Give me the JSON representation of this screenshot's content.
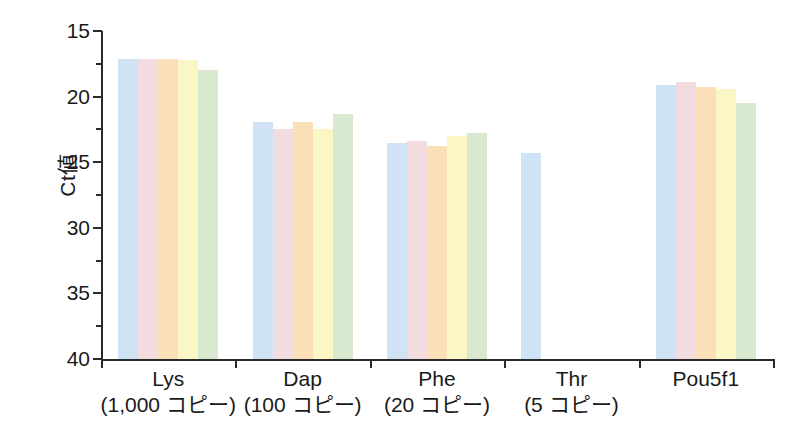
{
  "chart_data": {
    "type": "bar",
    "title": "",
    "subtitle": "",
    "xlabel": "",
    "ylabel": "Ct値",
    "ylim": [
      15,
      40
    ],
    "y_inverted": true,
    "y_ticks": [
      15,
      20,
      25,
      30,
      35,
      40
    ],
    "grid": false,
    "legend": "none",
    "categories": [
      "Lys",
      "Dap",
      "Phe",
      "Thr",
      "Pou5f1"
    ],
    "category_sublabels": [
      "(1,000 コピー)",
      "(100 コピー)",
      "(20 コピー)",
      "(5 コピー)",
      ""
    ],
    "series": [
      {
        "name": "replicate-1",
        "color": "#cfe3f4",
        "values": [
          17.1,
          21.9,
          23.5,
          24.3,
          19.1
        ]
      },
      {
        "name": "replicate-2",
        "color": "#f3dcdf",
        "values": [
          17.1,
          22.5,
          23.4,
          null,
          18.9
        ]
      },
      {
        "name": "replicate-3",
        "color": "#fbdfb9",
        "values": [
          17.1,
          21.9,
          23.8,
          null,
          19.3
        ]
      },
      {
        "name": "replicate-4",
        "color": "#fbf6c6",
        "values": [
          17.2,
          22.5,
          23.0,
          null,
          19.4
        ]
      },
      {
        "name": "replicate-5",
        "color": "#d8e9d0",
        "values": [
          18.0,
          21.3,
          22.8,
          null,
          20.5
        ]
      }
    ]
  },
  "axis": {
    "y_title": "Ct値",
    "y_tick_labels": [
      "15",
      "20",
      "25",
      "30",
      "35",
      "40"
    ]
  },
  "groups": [
    {
      "name": "Lys",
      "sub": "(1,000 コピー)"
    },
    {
      "name": "Dap",
      "sub": "(100 コピー)"
    },
    {
      "name": "Phe",
      "sub": "(20 コピー)"
    },
    {
      "name": "Thr",
      "sub": "(5 コピー)"
    },
    {
      "name": "Pou5f1",
      "sub": ""
    }
  ],
  "colors": {
    "blue": "#cfe3f4",
    "pink": "#f3dcdf",
    "orange": "#fbdfb9",
    "yellow": "#fbf6c6",
    "green": "#d8e9d0",
    "axis": "#2a2a2a",
    "background": "#ffffff"
  }
}
